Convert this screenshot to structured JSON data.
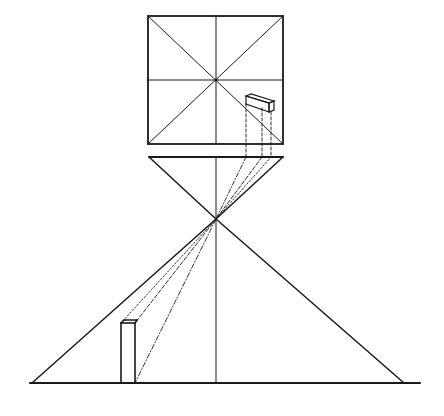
{
  "diagram": {
    "type": "perspective-projection",
    "colors": {
      "stroke": "#1a1a1a",
      "background": "#ffffff"
    },
    "elements": {
      "picture_square": {
        "x": 148,
        "y": 16,
        "w": 135,
        "h": 128
      },
      "eye_point": {
        "x": 216,
        "y": 219
      },
      "upper_triangle": {
        "top_y": 157,
        "left_x": 149,
        "right_x": 283
      },
      "lower_triangle": {
        "base_y": 383,
        "left_x": 32,
        "right_x": 404
      },
      "ground_line": {
        "y": 383,
        "x1": 30,
        "x2": 420
      },
      "bar": {
        "x": 121,
        "y": 323,
        "w": 14,
        "h": 60
      },
      "projected_box": {
        "x": 246,
        "y": 96,
        "w": 26,
        "h": 16
      }
    }
  }
}
